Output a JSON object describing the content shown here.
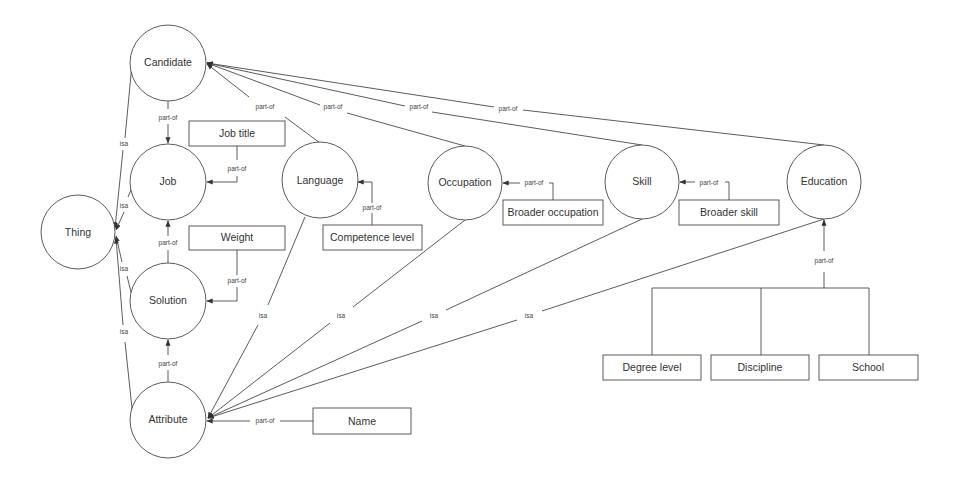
{
  "diagram": {
    "type": "ontology-graph",
    "concepts": [
      {
        "id": "candidate",
        "label": "Candidate",
        "cx": 168,
        "cy": 63,
        "r": 38
      },
      {
        "id": "job",
        "label": "Job",
        "cx": 168,
        "cy": 182,
        "r": 38
      },
      {
        "id": "thing",
        "label": "Thing",
        "cx": 78,
        "cy": 232,
        "r": 37
      },
      {
        "id": "solution",
        "label": "Solution",
        "cx": 168,
        "cy": 301,
        "r": 38
      },
      {
        "id": "attribute",
        "label": "Attribute",
        "cx": 168,
        "cy": 420,
        "r": 38
      },
      {
        "id": "language",
        "label": "Language",
        "cx": 320,
        "cy": 180,
        "r": 38
      },
      {
        "id": "occupation",
        "label": "Occupation",
        "cx": 465,
        "cy": 183,
        "r": 37
      },
      {
        "id": "skill",
        "label": "Skill",
        "cx": 642,
        "cy": 182,
        "r": 37
      },
      {
        "id": "education",
        "label": "Education",
        "cx": 824,
        "cy": 182,
        "r": 37
      }
    ],
    "properties": [
      {
        "id": "job-title",
        "label": "Job title",
        "x": 189,
        "y": 121,
        "w": 96,
        "h": 25
      },
      {
        "id": "weight",
        "label": "Weight",
        "x": 189,
        "y": 226,
        "w": 96,
        "h": 24
      },
      {
        "id": "competence-level",
        "label": "Competence level",
        "x": 323,
        "y": 225,
        "w": 99,
        "h": 25
      },
      {
        "id": "broader-occupation",
        "label": "Broader occupation",
        "x": 503,
        "y": 200,
        "w": 100,
        "h": 25
      },
      {
        "id": "broader-skill",
        "label": "Broader skill",
        "x": 679,
        "y": 200,
        "w": 100,
        "h": 25
      },
      {
        "id": "degree-level",
        "label": "Degree level",
        "x": 603,
        "y": 355,
        "w": 98,
        "h": 25
      },
      {
        "id": "discipline",
        "label": "Discipline",
        "x": 711,
        "y": 355,
        "w": 98,
        "h": 25
      },
      {
        "id": "school",
        "label": "School",
        "x": 819,
        "y": 355,
        "w": 99,
        "h": 25
      },
      {
        "id": "name",
        "label": "Name",
        "x": 313,
        "y": 408,
        "w": 98,
        "h": 26
      }
    ],
    "relation_labels": {
      "part_of": "part-of",
      "isa": "isa"
    },
    "edges": [
      {
        "from": "candidate",
        "to": "thing",
        "label": "isa"
      },
      {
        "from": "job",
        "to": "thing",
        "label": "isa"
      },
      {
        "from": "solution",
        "to": "thing",
        "label": "isa"
      },
      {
        "from": "attribute",
        "to": "thing",
        "label": "isa"
      },
      {
        "from": "job",
        "to": "candidate",
        "label": "part-of"
      },
      {
        "from": "language",
        "to": "candidate",
        "label": "part-of"
      },
      {
        "from": "occupation",
        "to": "candidate",
        "label": "part-of"
      },
      {
        "from": "skill",
        "to": "candidate",
        "label": "part-of"
      },
      {
        "from": "education",
        "to": "candidate",
        "label": "part-of"
      },
      {
        "from": "job-title",
        "to": "job",
        "label": "part-of"
      },
      {
        "from": "solution",
        "to": "job",
        "label": "part-of"
      },
      {
        "from": "weight",
        "to": "solution",
        "label": "part-of"
      },
      {
        "from": "attribute",
        "to": "solution",
        "label": "part-of"
      },
      {
        "from": "competence-level",
        "to": "language",
        "label": "part-of"
      },
      {
        "from": "broader-occupation",
        "to": "occupation",
        "label": "part-of"
      },
      {
        "from": "broader-skill",
        "to": "skill",
        "label": "part-of"
      },
      {
        "from": "degree-level",
        "to": "education",
        "label": "part-of"
      },
      {
        "from": "discipline",
        "to": "education",
        "label": "part-of"
      },
      {
        "from": "school",
        "to": "education",
        "label": "part-of"
      },
      {
        "from": "name",
        "to": "attribute",
        "label": "part-of"
      },
      {
        "from": "language",
        "to": "attribute",
        "label": "isa"
      },
      {
        "from": "occupation",
        "to": "attribute",
        "label": "isa"
      },
      {
        "from": "skill",
        "to": "attribute",
        "label": "isa"
      },
      {
        "from": "education",
        "to": "attribute",
        "label": "isa"
      }
    ]
  }
}
